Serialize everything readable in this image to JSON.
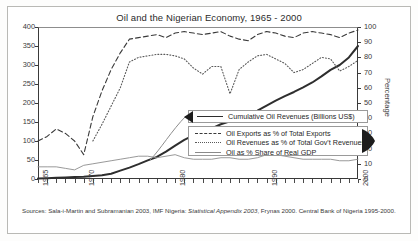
{
  "chart_data": {
    "type": "line",
    "title": "Oil and the Nigerian Economy, 1965 - 2000",
    "xlabel": "",
    "ylabel": "Billions (US$)",
    "ylabel_right": "Percentage",
    "xlim": [
      1965,
      2000
    ],
    "ylim": [
      0,
      400
    ],
    "ylim_right": [
      0,
      100
    ],
    "yticks": [
      0,
      50,
      100,
      150,
      200,
      250,
      300,
      350,
      400
    ],
    "yticks_right": [
      0,
      10,
      20,
      30,
      40,
      50,
      60,
      70,
      80,
      90,
      100
    ],
    "xticks_labeled": [
      1965,
      1970,
      1980,
      1990,
      2000
    ],
    "xtick_step": 1,
    "grid": false,
    "legend_position": "center-right",
    "x": [
      1965,
      1966,
      1967,
      1968,
      1969,
      1970,
      1971,
      1972,
      1973,
      1974,
      1975,
      1976,
      1977,
      1978,
      1979,
      1980,
      1981,
      1982,
      1983,
      1984,
      1985,
      1986,
      1987,
      1988,
      1989,
      1990,
      1991,
      1992,
      1993,
      1994,
      1995,
      1996,
      1997,
      1998,
      1999,
      2000
    ],
    "series": [
      {
        "name": "Cumulative Oil Revenues (Billions US$)",
        "axis": "left",
        "style": "solid-thick",
        "unit": "Billions US$",
        "values": [
          1,
          2,
          3,
          4,
          5,
          6,
          8,
          10,
          14,
          22,
          30,
          39,
          49,
          58,
          72,
          88,
          103,
          115,
          124,
          133,
          144,
          152,
          161,
          170,
          180,
          193,
          206,
          218,
          229,
          241,
          254,
          270,
          287,
          300,
          320,
          350
        ]
      },
      {
        "name": "Oil Exports as % of Total Exports",
        "axis": "right",
        "style": "dashed",
        "unit": "%",
        "values": [
          25,
          28,
          33,
          30,
          25,
          16,
          41,
          58,
          72,
          83,
          92,
          93,
          94,
          95,
          93,
          96,
          97,
          96,
          95,
          96,
          97,
          94,
          92,
          91,
          95,
          97,
          96,
          94,
          93,
          96,
          97,
          96,
          95,
          93,
          96,
          98
        ]
      },
      {
        "name": "Oil Revenues as % of Total Gov't Revenues",
        "axis": "right",
        "style": "dotted",
        "unit": "%",
        "values": [
          null,
          null,
          null,
          null,
          null,
          null,
          25,
          36,
          48,
          60,
          77,
          80,
          81,
          82,
          82,
          81,
          79,
          73,
          69,
          74,
          74,
          56,
          72,
          77,
          81,
          82,
          79,
          76,
          70,
          72,
          76,
          80,
          79,
          71,
          74,
          78
        ]
      },
      {
        "name": "Oil as % Share of Real GDP",
        "axis": "right",
        "style": "solid-thin",
        "unit": "%",
        "values": [
          8,
          8,
          8,
          7,
          6,
          9,
          10,
          11,
          12,
          13,
          14,
          15,
          15,
          14,
          15,
          16,
          14,
          13,
          13,
          13,
          14,
          14,
          13,
          13,
          14,
          16,
          16,
          15,
          14,
          13,
          13,
          13,
          13,
          12,
          12,
          13
        ]
      }
    ],
    "annotations": [
      {
        "name": "left-arrow-to-left-axis",
        "text": ""
      },
      {
        "name": "right-arrow-to-right-axis",
        "text": ""
      }
    ]
  },
  "legend": {
    "top": {
      "label": "Cumulative Oil Revenues (Billions US$)",
      "style": "solid-thick"
    },
    "bottom": [
      {
        "label": "Oil Exports as % of Total Exports",
        "style": "dashed"
      },
      {
        "label": "Oil Revenues as % of Total Gov't Revenues",
        "style": "dotted"
      },
      {
        "label": "Oil as % Share of Real GDP",
        "style": "solid-thin"
      }
    ]
  },
  "source": {
    "prefix": "Sources: Sala-i-Martin and Subramanian 2003, IMF Nigeria: ",
    "italic": "Statistical Appendix 2003",
    "suffix": ", Frynas 2000. Central Bank of Nigeria 1995-2000."
  }
}
